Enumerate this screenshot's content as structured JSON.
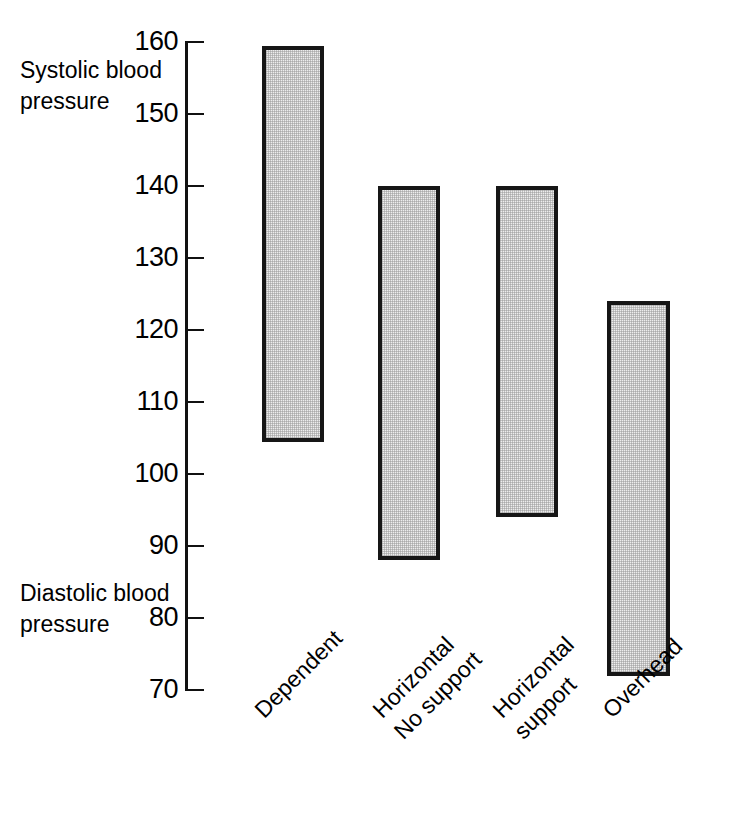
{
  "chart_data": {
    "type": "bar",
    "orientation": "vertical",
    "bar_style": "floating range bars (min-max)",
    "title": "",
    "subtitle": "",
    "xlabel": "",
    "ylabel": "",
    "ylim": [
      70,
      160
    ],
    "grid": false,
    "legend": false,
    "legend_position": "none",
    "y_ticks": [
      160,
      150,
      140,
      130,
      120,
      110,
      100,
      90,
      80,
      70
    ],
    "y_tick_labels": [
      "160",
      "150",
      "140",
      "130",
      "120",
      "110",
      "100",
      "90",
      "80",
      "70"
    ],
    "axis_captions": [
      {
        "id": "systolic",
        "lines": [
          "Systolic",
          "blood",
          "pressure"
        ]
      },
      {
        "id": "diastolic",
        "lines": [
          "Diastolic",
          "blood",
          "pressure"
        ]
      }
    ],
    "categories": [
      "Dependent",
      "Horizontal No support",
      "Horizontal support",
      "Overhead"
    ],
    "category_label_lines": [
      [
        "Dependent"
      ],
      [
        "Horizontal",
        "No support"
      ],
      [
        "Horizontal",
        "support"
      ],
      [
        "Overhead"
      ]
    ],
    "series": [
      {
        "name": "Diastolic blood pressure (bar bottom)",
        "values": [
          104.5,
          88,
          94,
          72
        ]
      },
      {
        "name": "Systolic blood pressure (bar top)",
        "values": [
          159.5,
          140,
          140,
          124
        ]
      }
    ],
    "bars": [
      {
        "category": "Dependent",
        "low": 104.5,
        "high": 159.5
      },
      {
        "category": "Horizontal No support",
        "low": 88,
        "high": 140
      },
      {
        "category": "Horizontal support",
        "low": 94,
        "high": 140
      },
      {
        "category": "Overhead",
        "low": 72,
        "high": 124
      }
    ],
    "colors": {
      "bar_fill": "#ededed",
      "bar_stroke": "#161616",
      "axis": "#111111",
      "text": "#000000",
      "background": "#ffffff"
    }
  }
}
